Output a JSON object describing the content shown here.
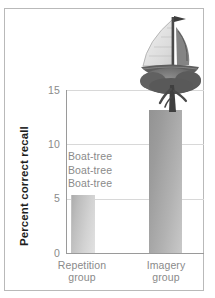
{
  "chart_data": {
    "type": "bar",
    "title": "",
    "xlabel": "",
    "ylabel": "Percent correct recall",
    "categories": [
      "Repetition group",
      "Imagery group"
    ],
    "values": [
      5.3,
      13.2
    ],
    "ylim": [
      0,
      15
    ],
    "yticks": [
      0,
      5,
      10,
      15
    ],
    "ytick_labels": [
      "0",
      "5",
      "10",
      "15"
    ],
    "grid": true,
    "legend": "none",
    "annotations": [
      "Boat-tree",
      "Boat-tree",
      "Boat-tree"
    ],
    "image_annotation": "sailboat-tree-illustration"
  },
  "axis": {
    "y_label": "Percent correct recall",
    "ticks": [
      {
        "label": "15",
        "value": 15
      },
      {
        "label": "10",
        "value": 10
      },
      {
        "label": "5",
        "value": 5
      },
      {
        "label": "0",
        "value": 0
      }
    ]
  },
  "categories": [
    {
      "line1": "Repetition",
      "line2": "group",
      "value": 5.3
    },
    {
      "line1": "Imagery",
      "line2": "group",
      "value": 13.2
    }
  ],
  "annotation": {
    "line1": "Boat-tree",
    "line2": "Boat-tree",
    "line3": "Boat-tree"
  },
  "colors": {
    "bar_repetition": "#c4c4c4",
    "bar_imagery": "#a5a5a5",
    "gridline": "#d8d8d8",
    "axis": "#9a9a9a",
    "tick_text": "#8a8a8a",
    "label_text": "#1d1d1d",
    "frame": "#b9b9b9",
    "background": "#ffffff"
  }
}
